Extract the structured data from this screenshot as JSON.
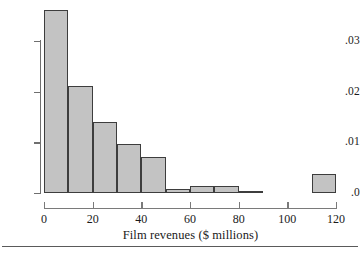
{
  "chart_data": {
    "type": "bar",
    "title": "",
    "xlabel": "Film revenues ($ millions)",
    "ylabel": "",
    "xlim": [
      0,
      120
    ],
    "ylim": [
      0,
      0.03
    ],
    "grid": false,
    "legend": "none",
    "bin_width": 10,
    "bin_edges": [
      0,
      10,
      20,
      30,
      40,
      50,
      60,
      70,
      80,
      90,
      110,
      120
    ],
    "categories": [
      "0-10",
      "10-20",
      "20-30",
      "30-40",
      "40-50",
      "50-60",
      "60-70",
      "70-80",
      "80-90",
      "110-120"
    ],
    "values": [
      0.0362,
      0.0211,
      0.014,
      0.0097,
      0.0071,
      0.0008,
      0.0014,
      0.0014,
      0.0,
      0.0037
    ],
    "bars": [
      {
        "name": "bin-0-10",
        "x0": 0,
        "x1": 10,
        "value": 0.0362
      },
      {
        "name": "bin-10-20",
        "x0": 10,
        "x1": 20,
        "value": 0.0211
      },
      {
        "name": "bin-20-30",
        "x0": 20,
        "x1": 30,
        "value": 0.014
      },
      {
        "name": "bin-30-40",
        "x0": 30,
        "x1": 40,
        "value": 0.0097
      },
      {
        "name": "bin-40-50",
        "x0": 40,
        "x1": 50,
        "value": 0.0071
      },
      {
        "name": "bin-50-60",
        "x0": 50,
        "x1": 60,
        "value": 0.0008
      },
      {
        "name": "bin-60-70",
        "x0": 60,
        "x1": 70,
        "value": 0.0014
      },
      {
        "name": "bin-70-80",
        "x0": 70,
        "x1": 80,
        "value": 0.0014
      },
      {
        "name": "bin-80-90",
        "x0": 80,
        "x1": 90,
        "value": 0.0
      },
      {
        "name": "bin-110-120",
        "x0": 110,
        "x1": 120,
        "value": 0.0037
      }
    ],
    "yticks": [
      0,
      0.01,
      0.02,
      0.03
    ],
    "ytick_labels": [
      ".0",
      ".01",
      ".02",
      ".03"
    ],
    "xticks": [
      0,
      20,
      40,
      60,
      80,
      100,
      120
    ],
    "xtick_labels": [
      "0",
      "20",
      "40",
      "60",
      "80",
      "100",
      "120"
    ],
    "colors": {
      "bar_fill": "#c3c3c3",
      "bar_edge": "#3d3d3d",
      "axis": "#6f6f6f",
      "text": "#1a1a1a",
      "rule": "#5a5a5a",
      "background": "#ffffff"
    }
  }
}
